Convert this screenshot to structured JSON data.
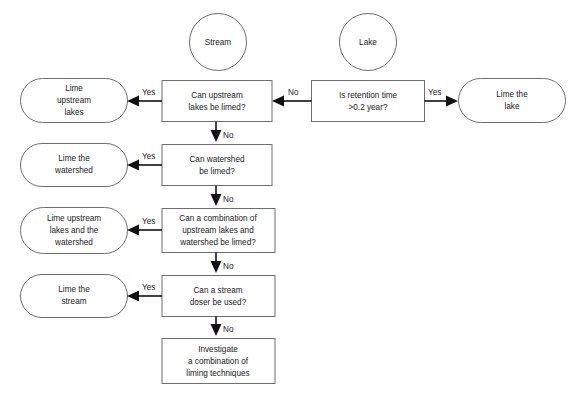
{
  "diagram": {
    "background_color": "#ffffff",
    "shape_stroke_color": "#6e6e6e",
    "edge_color": "#111111",
    "text_color": "#1a1a1a"
  },
  "start_nodes": [
    {
      "id": "stream",
      "label": "Stream",
      "shape": "circle"
    },
    {
      "id": "lake",
      "label": "Lake",
      "shape": "circle"
    }
  ],
  "decisions": [
    {
      "id": "upstream-lakes",
      "lines": [
        "Can upstream",
        "lakes be limed?"
      ],
      "yes_label": "Yes",
      "no_label": "No"
    },
    {
      "id": "watershed",
      "lines": [
        "Can watershed",
        "be limed?"
      ],
      "yes_label": "Yes",
      "no_label": "No"
    },
    {
      "id": "combination",
      "lines": [
        "Can a combination of",
        "upstream lakes and",
        "watershed be limed?"
      ],
      "yes_label": "Yes",
      "no_label": "No"
    },
    {
      "id": "stream-doser",
      "lines": [
        "Can a stream",
        "doser be used?"
      ],
      "yes_label": "Yes",
      "no_label": "No"
    },
    {
      "id": "retention-time",
      "lines": [
        "Is retention time",
        ">0.2 year?"
      ],
      "yes_label": "Yes",
      "no_label": "No"
    }
  ],
  "outcomes": [
    {
      "id": "lime-upstream-lakes",
      "lines": [
        "Lime",
        "upstream",
        "lakes"
      ],
      "shape": "stadium"
    },
    {
      "id": "lime-watershed",
      "lines": [
        "Lime the",
        "watershed"
      ],
      "shape": "stadium"
    },
    {
      "id": "lime-upstream-lakes-and-watershed",
      "lines": [
        "Lime upstream",
        "lakes and the",
        "watershed"
      ],
      "shape": "stadium"
    },
    {
      "id": "lime-stream",
      "lines": [
        "Lime the",
        "stream"
      ],
      "shape": "stadium"
    },
    {
      "id": "lime-lake",
      "lines": [
        "Lime the",
        "lake"
      ],
      "shape": "stadium"
    }
  ],
  "terminal_process": {
    "id": "investigate",
    "lines": [
      "Investigate",
      "a combination of",
      "liming techniques"
    ],
    "shape": "rectangle"
  }
}
